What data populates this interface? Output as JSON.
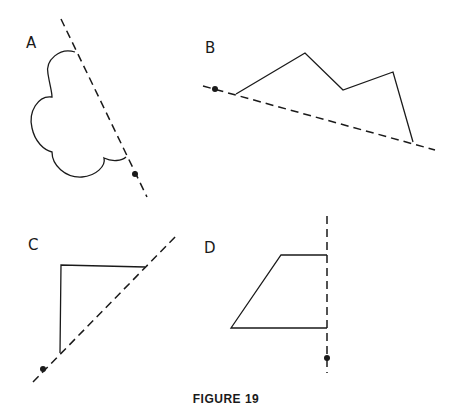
{
  "figure": {
    "caption": "FIGURE 19",
    "panels": [
      {
        "label": "A",
        "shape": "cloud (four-lobed curve)",
        "axis": "dashed line",
        "marker": "dot on line"
      },
      {
        "label": "B",
        "shape": "zigzag polygon",
        "axis": "dashed line",
        "marker": "dot on line"
      },
      {
        "label": "C",
        "shape": "right triangle",
        "axis": "dashed line",
        "marker": "dot on line"
      },
      {
        "label": "D",
        "shape": "trapezoid",
        "axis": "dashed line",
        "marker": "dot on line"
      }
    ]
  },
  "colors": {
    "ink": "#1a1a1a",
    "background": "#ffffff"
  }
}
